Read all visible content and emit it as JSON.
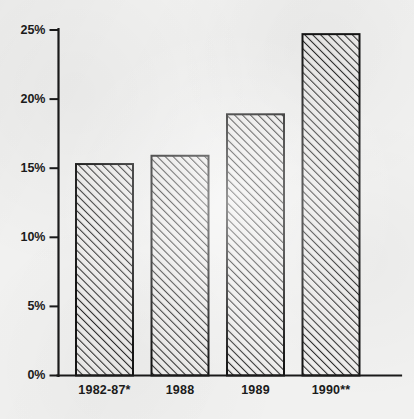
{
  "chart_data": {
    "type": "bar",
    "title": "",
    "subtitle": "",
    "xlabel": "",
    "ylabel": "",
    "categories": [
      "1982-87*",
      "1988",
      "1989",
      "1990**"
    ],
    "values": [
      15.3,
      15.9,
      18.9,
      24.7
    ],
    "value_labels": [
      "15.3%",
      "15.9%",
      "18.9%",
      "24.7%"
    ],
    "ylim": [
      0,
      25
    ],
    "ytick_values": [
      0,
      5,
      10,
      15,
      20,
      25
    ],
    "ytick_labels": [
      "0%",
      "5%",
      "10%",
      "15%",
      "20%",
      "25%"
    ],
    "grid": false,
    "legend": false,
    "legend_position": "none",
    "annotations": [],
    "series": [
      {
        "name": "",
        "values": [
          15.3,
          15.9,
          18.9,
          24.7
        ]
      }
    ],
    "style": {
      "bar_fill": "#ededec",
      "bar_hatch": "diagonal-forward",
      "bar_outline": "#141414",
      "axis_color": "#1a1a1a",
      "background": "#f1f1f0",
      "text_color": "#1b1b1b"
    }
  }
}
